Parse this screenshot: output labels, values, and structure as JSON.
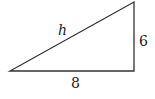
{
  "diagram": {
    "type": "right-triangle",
    "labels": {
      "hypotenuse": "h",
      "vertical_leg": "6",
      "horizontal_leg": "8"
    },
    "stroke_color": "#333333"
  }
}
